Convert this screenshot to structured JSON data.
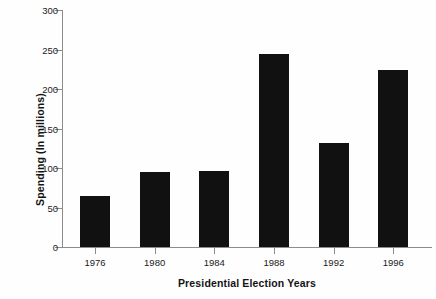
{
  "chart_data": {
    "type": "bar",
    "title": "",
    "xlabel": "Presidential Election Years",
    "ylabel": "Spending (In millions)",
    "categories": [
      "1976",
      "1980",
      "1984",
      "1988",
      "1992",
      "1996"
    ],
    "values": [
      64,
      95,
      96,
      244,
      132,
      224
    ],
    "ylim": [
      0,
      300
    ],
    "yticks": [
      0,
      50,
      100,
      150,
      200,
      250,
      300
    ],
    "ytick_labels": [
      "0",
      "50",
      "100",
      "150",
      "200",
      "250",
      "300"
    ],
    "grid": false,
    "legend": null,
    "bar_color": "#111111",
    "axis_color": "#8c8c8c",
    "background_color": "#fefefe"
  }
}
